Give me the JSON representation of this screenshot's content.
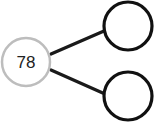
{
  "diagram": {
    "type": "number-bond",
    "whole": {
      "label": "78",
      "stroke": "#bdbdbd"
    },
    "parts": [
      {
        "label": "",
        "stroke": "#111111"
      },
      {
        "label": "",
        "stroke": "#111111"
      }
    ],
    "connector_color": "#1a1a1a"
  }
}
